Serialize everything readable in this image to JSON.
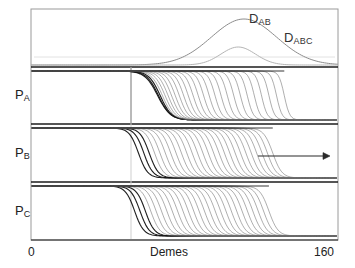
{
  "figure": {
    "type": "multi-panel-line"
  },
  "axis": {
    "x_label": "Demes",
    "x_min_label": "0",
    "x_max_label": "160",
    "x_min": 0,
    "x_max": 160
  },
  "panels": {
    "ld": {
      "name": "linkage-disequilibrium-panel",
      "curves": [
        {
          "label_main": "D",
          "label_sub": "AB",
          "peak_x": 111,
          "peak_height": 0.92,
          "width": 17,
          "color": "#8c8c8c"
        },
        {
          "label_main": "D",
          "label_sub": "ABC",
          "peak_x": 108,
          "peak_height": 0.36,
          "width": 9,
          "color": "#b5b5b5"
        }
      ]
    },
    "pa": {
      "name": "panel-pa",
      "label_main": "P",
      "label_sub": "A"
    },
    "pb": {
      "name": "panel-pb",
      "label_main": "P",
      "label_sub": "B"
    },
    "pc": {
      "name": "panel-pc",
      "label_main": "P",
      "label_sub": "C"
    }
  },
  "annotations": {
    "direction_arrow": "arrow-right"
  },
  "colors": {
    "frame": "#9a9a9a",
    "divider": "#1d1d1d",
    "curve": "#6e6e6e",
    "curve_dark": "#151515",
    "marker_line": "#cfcfcf",
    "text": "#1a1a1a"
  },
  "chart_data": {
    "type": "line",
    "title": "",
    "xlabel": "Demes",
    "ylabel": "",
    "xlim": [
      0,
      160
    ],
    "ylim": [
      0,
      1
    ],
    "grid": false,
    "legend": "inline-annotation",
    "panels": [
      {
        "name": "D",
        "series": [
          {
            "name": "D_AB",
            "peak_x": 111,
            "peak_y": 0.92,
            "sigma": 17
          },
          {
            "name": "D_ABC",
            "peak_x": 108,
            "peak_y": 0.36,
            "sigma": 9
          }
        ]
      },
      {
        "name": "P_A",
        "series_count": 26,
        "front_start_x": 66,
        "front_end_x": 132,
        "steepness": 0.55,
        "note": "fronts bunched at left, fanning rightward"
      },
      {
        "name": "P_B",
        "series_count": 26,
        "front_start_x": 56,
        "front_end_x": 126,
        "steepness": 0.42,
        "note": "evenly spaced travelling wave fronts"
      },
      {
        "name": "P_C",
        "series_count": 26,
        "front_start_x": 54,
        "front_end_x": 124,
        "steepness": 0.42,
        "note": "evenly spaced travelling wave fronts"
      }
    ]
  }
}
